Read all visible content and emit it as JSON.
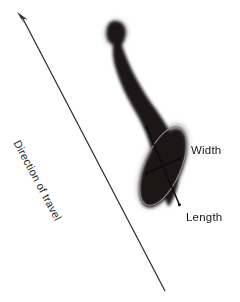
{
  "figure": {
    "background_color": "#ffffff",
    "width": 240,
    "height": 302
  },
  "labels": {
    "width": "Width",
    "length": "Length",
    "direction": "Direction of travel"
  },
  "ghost_text": {
    "line1": "",
    "line2": ""
  },
  "colors": {
    "stain_fill": "#1a1617",
    "stain_halo": "#6f686a",
    "arrow": "#2f2f33",
    "measure_line": "#0d0c0d",
    "ellipse_outline": "#8d8589",
    "text": "#1a1a1a"
  },
  "icons": {
    "arrow": "direction-arrow-icon",
    "stain": "bloodstain-icon",
    "ellipse": "stain-ellipse-overlay-icon",
    "length_axis": "length-measure-line-icon",
    "width_axis": "width-measure-line-icon"
  },
  "geometry": {
    "arrow_start": [
      165,
      291
    ],
    "arrow_end": [
      17,
      12
    ],
    "stain_head": [
      116,
      33
    ],
    "stain_tip": [
      176,
      207
    ],
    "ellipse_center": [
      163,
      166
    ],
    "ellipse_rx": 18,
    "ellipse_ry": 42,
    "ellipse_rotation_deg": 23
  }
}
